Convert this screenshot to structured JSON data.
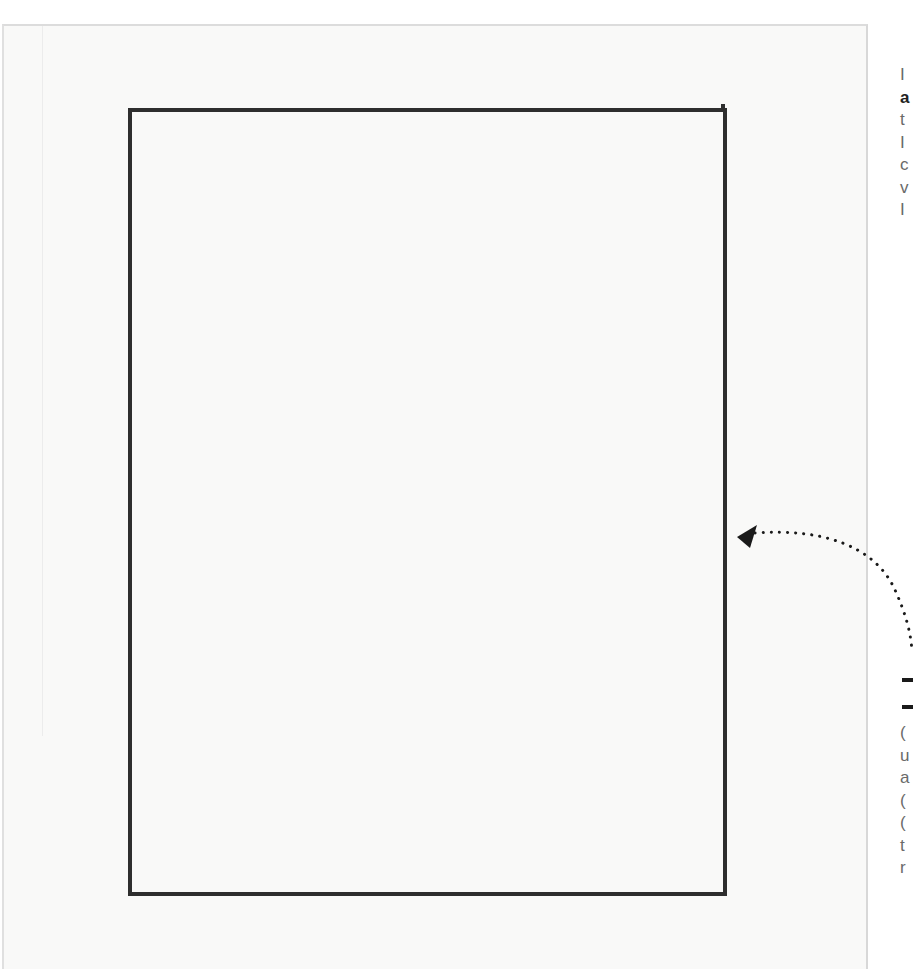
{
  "page": {
    "type": "scanned-book-page",
    "figure": {
      "shape": "rectangle-frame",
      "stroke_color": "#2e2e2e",
      "fill_color": "#f9f9f8"
    },
    "arrow": {
      "style": "dotted-curved",
      "direction": "points-left-to-frame",
      "color": "#1a1a1a"
    },
    "right_column_top_fragments": [
      "I",
      "a",
      "t",
      "I",
      "c",
      "v",
      "I"
    ],
    "right_column_bottom_fragments": [
      "(",
      "u",
      "a",
      "(",
      "(",
      "t",
      "r"
    ]
  }
}
